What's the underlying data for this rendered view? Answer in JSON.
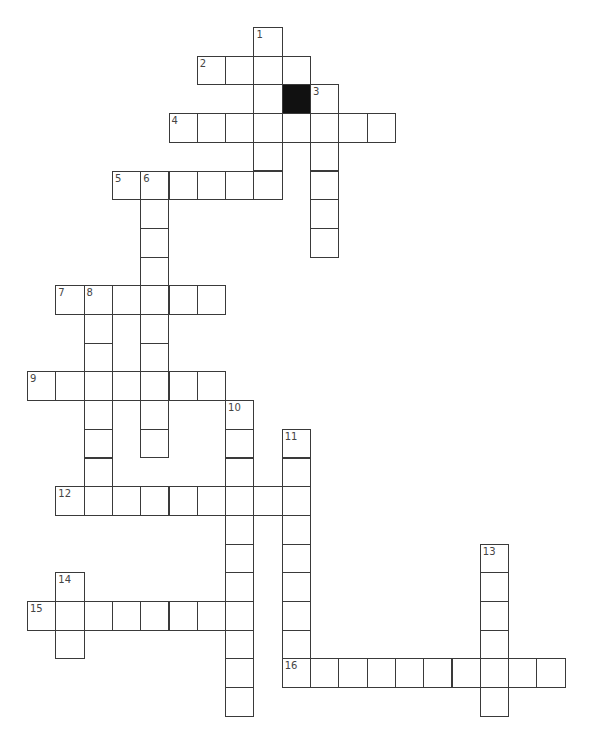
{
  "puzzle": {
    "type": "crossword",
    "cell_w": 28.3,
    "cell_h": 28.7,
    "origin_x": 27,
    "origin_y": 27,
    "colors": {
      "border": "#3a3a3a",
      "fill": "#ffffff",
      "block": "#111111",
      "number": "#444444"
    },
    "blocks": [
      {
        "row": 2,
        "col": 9
      }
    ],
    "entries": [
      {
        "number": "1",
        "direction": "down",
        "row": 0,
        "col": 8,
        "length": 6
      },
      {
        "number": "2",
        "direction": "across",
        "row": 1,
        "col": 6,
        "length": 4
      },
      {
        "number": "3",
        "direction": "down",
        "row": 2,
        "col": 10,
        "length": 6
      },
      {
        "number": "4",
        "direction": "across",
        "row": 3,
        "col": 5,
        "length": 8
      },
      {
        "number": "5",
        "direction": "across",
        "row": 5,
        "col": 3,
        "length": 6
      },
      {
        "number": "6",
        "direction": "down",
        "row": 5,
        "col": 4,
        "length": 10
      },
      {
        "number": "7",
        "direction": "across",
        "row": 9,
        "col": 1,
        "length": 6
      },
      {
        "number": "8",
        "direction": "down",
        "row": 9,
        "col": 2,
        "length": 8
      },
      {
        "number": "9",
        "direction": "across",
        "row": 12,
        "col": 0,
        "length": 7
      },
      {
        "number": "10",
        "direction": "down",
        "row": 13,
        "col": 7,
        "length": 11
      },
      {
        "number": "11",
        "direction": "down",
        "row": 14,
        "col": 9,
        "length": 9
      },
      {
        "number": "12",
        "direction": "across",
        "row": 16,
        "col": 1,
        "length": 9
      },
      {
        "number": "13",
        "direction": "down",
        "row": 18,
        "col": 16,
        "length": 6
      },
      {
        "number": "14",
        "direction": "down",
        "row": 19,
        "col": 1,
        "length": 3
      },
      {
        "number": "15",
        "direction": "across",
        "row": 20,
        "col": 0,
        "length": 8
      },
      {
        "number": "16",
        "direction": "across",
        "row": 22,
        "col": 9,
        "length": 10
      }
    ]
  }
}
